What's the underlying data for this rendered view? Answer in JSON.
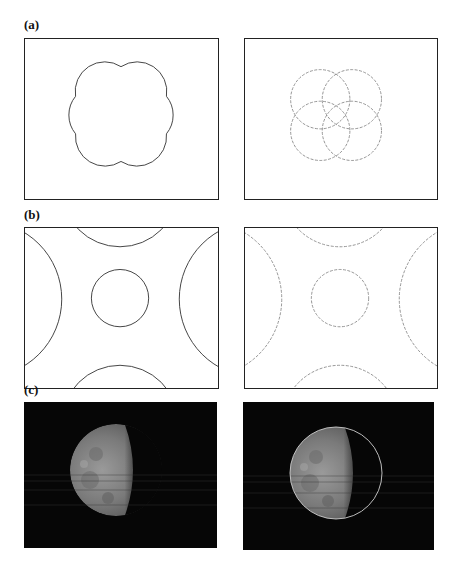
{
  "figure": {
    "rows": [
      {
        "label": "(a)",
        "description": "Four overlapping circles forming a cloverleaf outline (left) and the individual detected circles (right)",
        "left_panel": {
          "content": "cloverleaf-outline",
          "stroke": "#444444"
        },
        "right_panel": {
          "content": "four-detected-circles",
          "stroke": "#888888"
        }
      },
      {
        "label": "(b)",
        "description": "Central circle surrounded by four partially visible circles at the edges (left), detected circles dashed (right)",
        "left_panel": {
          "content": "five-circles-solid",
          "stroke": "#444444"
        },
        "right_panel": {
          "content": "five-circles-dashed",
          "stroke": "#888888"
        }
      },
      {
        "label": "(c)",
        "description": "Partially eclipsed moon photograph (left) and the same image with fitted circle overlay (right)",
        "left_panel": {
          "content": "moon-photo",
          "background": "#060606"
        },
        "right_panel": {
          "content": "moon-photo-with-fit-circle",
          "background": "#060606",
          "overlay_stroke": "#cfcfcf"
        }
      }
    ]
  }
}
